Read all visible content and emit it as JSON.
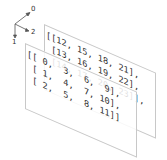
{
  "axes": {
    "labels": [
      "0",
      "1",
      "2"
    ]
  },
  "array": {
    "shape": [
      2,
      3,
      4
    ],
    "layers": [
      {
        "rows": [
          [
            0,
            3,
            6,
            9
          ],
          [
            1,
            4,
            7,
            10
          ],
          [
            2,
            5,
            8,
            11
          ]
        ]
      },
      {
        "rows": [
          [
            12,
            15,
            18,
            21
          ],
          [
            13,
            16,
            19,
            22
          ],
          [
            14,
            17,
            20,
            23
          ]
        ]
      }
    ],
    "front_text": "[[ 0,  3,  6,  9],\n [ 1,  4,  7, 10],\n [ 2,  5,  8, 11]]",
    "back_text": "[[12, 15, 18, 21],\n [13, 16, 19, 22],\n [14, 17, 20, 23]],"
  }
}
